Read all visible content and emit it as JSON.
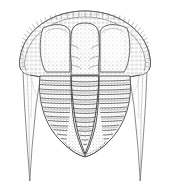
{
  "image": {
    "kind": "scientific-line-illustration",
    "subject": "trilobite",
    "view": "dorsal",
    "width": 170,
    "height": 196,
    "background_color": "#ffffff",
    "ink_color": "#4a4a4a",
    "stipple_color": "#8d8d8d",
    "technique": "pen-and-ink stipple engraving",
    "caption_text": "",
    "visible_labels": []
  },
  "anatomy": {
    "cephalon": {
      "name": "cephalon",
      "center_x": 85,
      "top_y": 12,
      "half_width": 57,
      "bottom_y": 78,
      "border_rim": {
        "name": "cephalic-border",
        "tick_count": 46,
        "texture": "radial pits"
      },
      "glabella": {
        "name": "glabella",
        "center_x": 85,
        "top_y": 24,
        "bottom_y": 76,
        "half_width": 13,
        "furrow_pairs": 3
      },
      "eye_lobes": [
        {
          "name": "left-palpebral-lobe",
          "cx": 58,
          "cy": 47,
          "rx": 17,
          "ry": 24
        },
        {
          "name": "right-palpebral-lobe",
          "cx": 112,
          "cy": 47,
          "rx": 17,
          "ry": 24
        }
      ],
      "genal_spines": [
        {
          "name": "left-genal-spine",
          "base_x": 30,
          "base_y": 66,
          "tip_x": 30,
          "tip_y": 181
        },
        {
          "name": "right-genal-spine",
          "base_x": 140,
          "base_y": 66,
          "tip_x": 140,
          "tip_y": 181
        }
      ]
    },
    "thorax": {
      "name": "thorax",
      "top_y": 76,
      "bottom_y": 133,
      "segment_count": 13,
      "axial_lobe": {
        "name": "axial-lobe",
        "top_half_width": 14,
        "bottom_half_width": 6,
        "ring_count": 13
      },
      "pleural_lobes": {
        "name": "pleural-lobes",
        "rib_count": 13,
        "top_half_width": 45,
        "bottom_half_width": 34
      }
    },
    "pygidium": {
      "name": "pygidium",
      "top_y": 130,
      "tip_y": 156,
      "half_width": 30,
      "ring_count": 4
    }
  }
}
